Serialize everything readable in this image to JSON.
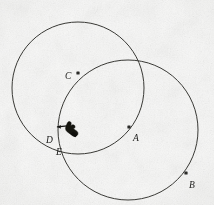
{
  "figure": {
    "background_color": "#f7f7f6",
    "ink_color": "#2a2a28",
    "canvas": {
      "width": 214,
      "height": 205
    }
  },
  "circles": [
    {
      "id": "left-circle",
      "name": "circle-through-C-D",
      "center_x": 78,
      "center_y": 88,
      "radius": 66,
      "stroke": "#3a3a36",
      "stroke_width": 1.0
    },
    {
      "id": "right-circle",
      "name": "circle-centered-at-A",
      "center_x": 128,
      "center_y": 130,
      "radius": 70,
      "stroke": "#3a3a36",
      "stroke_width": 1.0
    }
  ],
  "points": [
    {
      "id": "A",
      "label": "A",
      "x": 129,
      "y": 127,
      "label_x": 133,
      "label_y": 134,
      "marker": "dot",
      "role": "center-of-right-circle"
    },
    {
      "id": "B",
      "label": "B",
      "x": 186,
      "y": 173,
      "label_x": 189,
      "label_y": 181,
      "marker": "dot",
      "role": "point-on-right-circle"
    },
    {
      "id": "C",
      "label": "C",
      "x": 78,
      "y": 73,
      "label_x": 65,
      "label_y": 72,
      "marker": "dot",
      "role": "point-on-circles"
    },
    {
      "id": "D",
      "label": "D",
      "x": 60,
      "y": 129,
      "label_x": 46,
      "label_y": 136,
      "marker": "none",
      "role": "lower-intersection-region"
    },
    {
      "id": "E",
      "label": "E",
      "x": 64,
      "y": 140,
      "label_x": 56,
      "label_y": 148,
      "marker": "none",
      "role": "lower-intersection-region"
    }
  ],
  "cursor": {
    "name": "hand-pointer-cursor",
    "x": 57,
    "y": 119,
    "width": 28,
    "height": 26,
    "color": "#111110"
  }
}
